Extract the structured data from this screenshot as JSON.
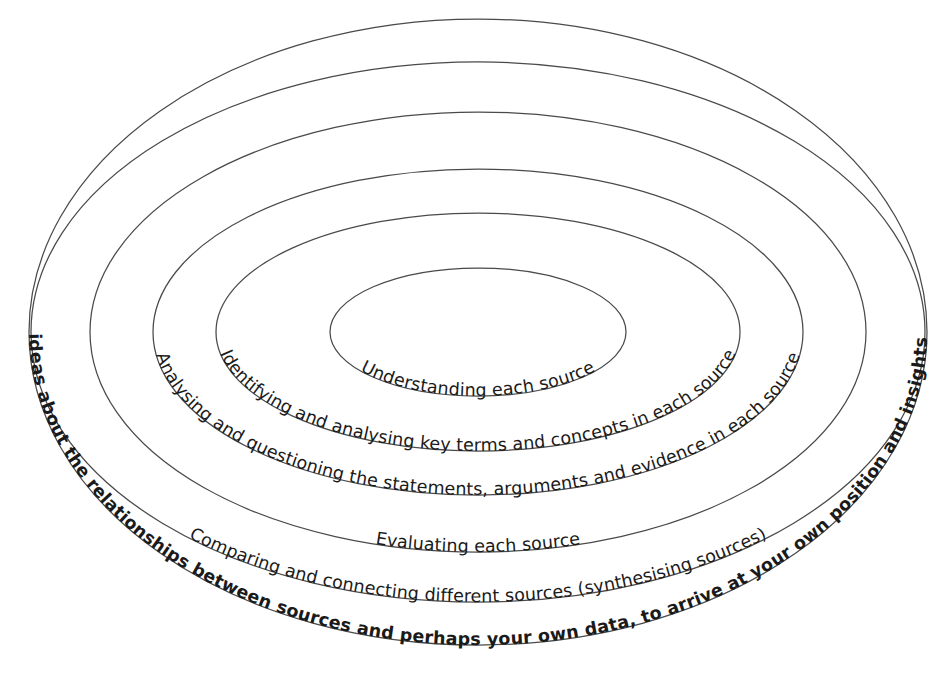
{
  "diagram": {
    "type": "concentric-ellipses",
    "background_color": "#ffffff",
    "outline_color": "#4a4a4a",
    "text_color": "#1a1a1a",
    "ring_count": 5,
    "rings": [
      {
        "index": 1,
        "level": "innermost",
        "label": "Understanding each source",
        "weight": "regular",
        "placement": "inside-lower-arc",
        "cx": 478,
        "cy": 332,
        "rx": 148,
        "ry": 64
      },
      {
        "index": 2,
        "level": "second",
        "label": "Identifying and analysing key terms and concepts in each source",
        "weight": "regular",
        "placement": "on-lower-arc",
        "cx": 478,
        "cy": 332,
        "rx": 262,
        "ry": 119
      },
      {
        "index": 3,
        "level": "third",
        "label": "Analysing and questioning the statements, arguments and evidence in each source",
        "weight": "regular",
        "placement": "on-lower-arc",
        "cx": 478,
        "cy": 332,
        "rx": 325,
        "ry": 163
      },
      {
        "index": 4,
        "level": "fourth",
        "label": "Evaluating each source",
        "weight": "regular",
        "placement": "inside-lower-arc",
        "cx": 478,
        "cy": 332,
        "rx": 388,
        "ry": 220
      },
      {
        "index": 5,
        "level": "fifth",
        "label": "Comparing and connecting different sources (synthesising sources)",
        "weight": "regular",
        "placement": "on-lower-arc",
        "cx": 478,
        "cy": 332,
        "rx": 447,
        "ry": 270
      },
      {
        "index": 6,
        "level": "outermost",
        "label": "Using your ideas about the relationships between sources and perhaps your own  position and insights (synthesis)",
        "weight": "bold",
        "placement": "on-lower-arc",
        "cx": 478,
        "cy": 332,
        "rx": 449,
        "ry": 313
      }
    ],
    "labels": {
      "innermost": "Understanding each source",
      "ring2": "Identifying and analysing key terms and concepts in each source",
      "ring3": "Analysing and questioning the statements, arguments and evidence in each source",
      "evaluating": "Evaluating each source",
      "ring4": "Comparing and connecting different sources (synthesising sources)",
      "outermost": "Using your ideas about the relationships between sources and perhaps your own data, to arrive at your own  position and insights (synthesis)"
    }
  }
}
